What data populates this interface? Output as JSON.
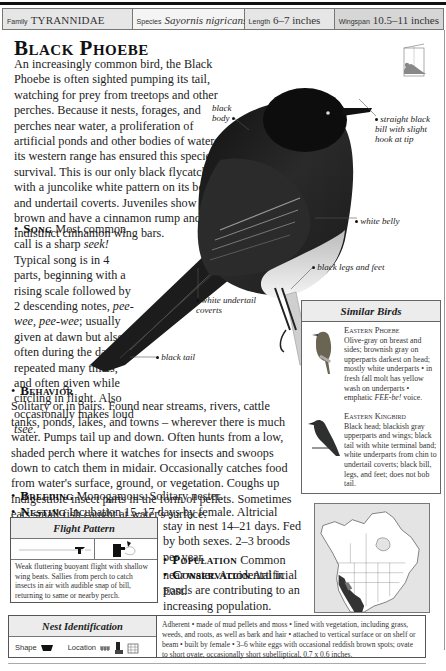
{
  "header": {
    "family_label": "Family",
    "family_value": "TYRANNIDAE",
    "species_label": "Species",
    "species_value": "Sayornis nigricans",
    "length_label": "Length",
    "length_value": "6–7 inches",
    "wingspan_label": "Wingspan",
    "wingspan_value": "10.5–11 inches"
  },
  "title": "Black Phoebe",
  "intro": "An increasingly common bird, the Black Phoebe is often sighted pumping its tail, watching for prey from treetops and other perches. Because it nests, forages, and perches near water, a proliferation of artificial ponds and other bodies of water in its western range has ensured this species' survival. This is our only black flycatcher with a juncolike white pattern on its belly and undertail coverts. Juveniles show more brown and have a cinnamon rump and two indistinct cinnamon wing bars.",
  "sections": {
    "song": {
      "heading": "Song",
      "text_1": "Most common call is a sharp ",
      "text_2": "seek!",
      "text_3": " Typical song is in 4 parts, beginning with a rising scale followed by 2 descending notes, ",
      "text_4": "pee-wee, pee-wee",
      "text_5": "; usually given at dawn but also often during the day, repeated many times, and often given while circling in flight. Also occasionally makes loud ",
      "text_6": "tsee",
      "text_7": "."
    },
    "behavior": {
      "heading": "Behavior",
      "text": "Solitary or in pairs. Found near streams, rivers, cattle tanks, ponds, lakes, and towns – wherever there is much water. Pumps tail up and down. Often hunts from a low, shaded perch where it watches for insects and swoops down to catch them in midair. Occasionally catches food from water's surface, ground, or vegetation. Coughs up indigestible insect parts in the form of pellets. Sometimes eats small fish caught at water's surface."
    },
    "breeding": {
      "heading": "Breeding",
      "text": "Monogamous. Solitary nester."
    },
    "nesting": {
      "heading": "Nesting",
      "text_first": "Incubation 15–17 days by female. Altricial young",
      "text_rest": "stay in nest 14–21 days. Fed by both sexes. 2–3 broods per year."
    },
    "population": {
      "heading": "Population",
      "text": "Common near water. Accidental in East."
    },
    "conservation": {
      "heading": "Conservation",
      "text": "Artificial ponds are contributing to an increasing population."
    }
  },
  "annotations": {
    "black_body_1": "black",
    "black_body_2": "body",
    "bill_1": "straight black",
    "bill_2": "bill with slight",
    "bill_3": "hook at tip",
    "white_belly": "white belly",
    "legs": "black legs and feet",
    "undertail_1": "white undertail",
    "undertail_2": "coverts",
    "tail": "black tail"
  },
  "similar_birds": {
    "heading": "Similar Birds",
    "items": [
      {
        "name": "Eastern Phoebe",
        "text_1": "Olive-gray on breast and sides; brownish gray on upperparts darkest on head; mostly white underparts • in fresh fall molt has yellow wash on underparts • emphatic ",
        "text_2": "FEE-be!",
        "text_3": " voice."
      },
      {
        "name": "Eastern Kingbird",
        "text_1": "Black head; blackish gray upperparts and wings; black tail with white terminal band; white underparts from chin to undertail coverts; black bill, legs, and feet; does not bob tail.",
        "text_2": "",
        "text_3": ""
      }
    ]
  },
  "flight_pattern": {
    "heading": "Flight Pattern",
    "description": "Weak fluttering buoyant flight with shallow wing beats. Sallies from perch to catch insects in air with audible snap of bill, returning to same or nearby perch."
  },
  "nest_identification": {
    "heading": "Nest Identification",
    "shape_label": "Shape",
    "location_label": "Location",
    "description": "Adherent • made of mud pellets and moss • lined with vegetation, including grass, weeds, and roots, as well as bark and hair • attached to vertical surface or on shelf or beam • built by female • 3–6 white eggs with occasional reddish brown spots; ovate to short ovate, occasionally short subelliptical, 0.7 x 0.6 inches."
  },
  "icons": {
    "bullet": "•",
    "field_guide": "field-guide-bird-icon",
    "nest_shape": "cup-nest-icon",
    "location_1": "shrub-icon",
    "location_2": "building-icon",
    "location_3": "bridge-icon"
  }
}
